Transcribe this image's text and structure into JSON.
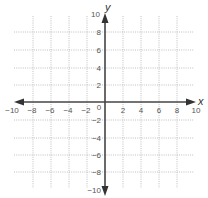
{
  "diagram": {
    "type": "coordinate-plane",
    "x_axis": {
      "label": "x",
      "min": -10,
      "max": 10,
      "tick_labels": [
        "-10",
        "-8",
        "-6",
        "-4",
        "-2",
        "0",
        "2",
        "4",
        "6",
        "8",
        "10"
      ]
    },
    "y_axis": {
      "label": "y",
      "min": -10,
      "max": 10,
      "tick_labels_positive": [
        "10",
        "8",
        "6",
        "4",
        "2"
      ],
      "tick_labels_negative": [
        "-2",
        "-4",
        "-6",
        "-8",
        "-10"
      ]
    },
    "grid": {
      "step": 2,
      "style": "dotted"
    },
    "colors": {
      "axis": "#444444",
      "grid": "#aaaaaa",
      "text": "#555555"
    }
  }
}
